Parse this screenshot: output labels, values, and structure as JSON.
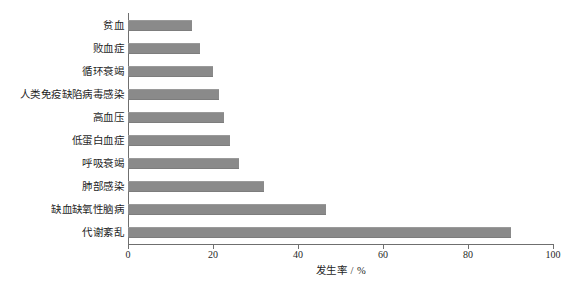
{
  "chart_data": {
    "type": "bar",
    "orientation": "horizontal",
    "title": "",
    "xlabel": "发生率 / %",
    "ylabel": "",
    "xlim": [
      0,
      100
    ],
    "xticks": [
      0,
      20,
      40,
      60,
      80,
      100
    ],
    "xtick_labels": [
      "0",
      "20",
      "40",
      "60",
      "80",
      "100"
    ],
    "grid": false,
    "legend": null,
    "bar_color": "#8a8a8a",
    "categories": [
      "贫血",
      "败血症",
      "循环衰竭",
      "人类免疫缺陷病毒感染",
      "高血压",
      "低蛋白血症",
      "呼吸衰竭",
      "肺部感染",
      "缺血缺氧性脑病",
      "代谢紊乱"
    ],
    "values": [
      15,
      17,
      20,
      21.5,
      22.5,
      24,
      26,
      32,
      46.5,
      90
    ]
  }
}
